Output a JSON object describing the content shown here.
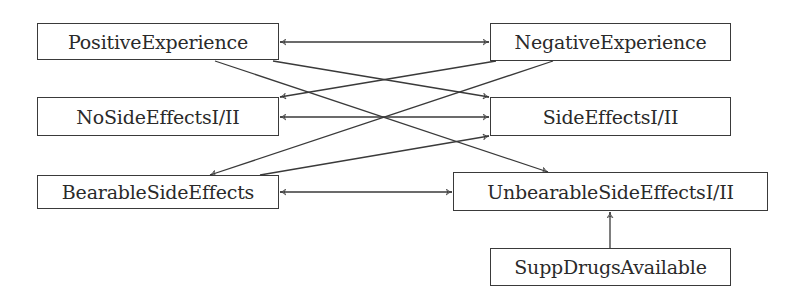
{
  "diagram": {
    "type": "directed-graph",
    "nodes": [
      {
        "id": "positive",
        "label": "PositiveExperience",
        "x": 37,
        "y": 23,
        "w": 242,
        "h": 37
      },
      {
        "id": "noside",
        "label": "NoSideEffectsI/II",
        "x": 37,
        "y": 97,
        "w": 242,
        "h": 39
      },
      {
        "id": "bearable",
        "label": "BearableSideEffects",
        "x": 37,
        "y": 175,
        "w": 242,
        "h": 34
      },
      {
        "id": "negative",
        "label": "NegativeExperience",
        "x": 490,
        "y": 23,
        "w": 241,
        "h": 38
      },
      {
        "id": "sideeffects",
        "label": "SideEffectsI/II",
        "x": 490,
        "y": 97,
        "w": 241,
        "h": 39
      },
      {
        "id": "unbearable",
        "label": "UnbearableSideEffectsI/II",
        "x": 453,
        "y": 172,
        "w": 315,
        "h": 39
      },
      {
        "id": "suppdrugs",
        "label": "SuppDrugsAvailable",
        "x": 490,
        "y": 248,
        "w": 241,
        "h": 38
      }
    ],
    "edges": [
      {
        "from": "positive",
        "to": "negative",
        "bidirectional": true,
        "x1": 280,
        "y1": 42,
        "x2": 489,
        "y2": 42
      },
      {
        "from": "noside",
        "to": "sideeffects",
        "bidirectional": true,
        "x1": 280,
        "y1": 117,
        "x2": 489,
        "y2": 117
      },
      {
        "from": "bearable",
        "to": "unbearable",
        "bidirectional": true,
        "x1": 280,
        "y1": 192,
        "x2": 452,
        "y2": 192
      },
      {
        "from": "positive",
        "to": "sideeffects",
        "bidirectional": false,
        "x1": 273,
        "y1": 61,
        "x2": 489,
        "y2": 97
      },
      {
        "from": "positive",
        "to": "unbearable",
        "bidirectional": false,
        "x1": 215,
        "y1": 61,
        "x2": 548,
        "y2": 172
      },
      {
        "from": "negative",
        "to": "noside",
        "bidirectional": false,
        "x1": 496,
        "y1": 61,
        "x2": 280,
        "y2": 97
      },
      {
        "from": "negative",
        "to": "bearable",
        "bidirectional": false,
        "x1": 553,
        "y1": 61,
        "x2": 210,
        "y2": 175
      },
      {
        "from": "bearable",
        "to": "sideeffects",
        "bidirectional": false,
        "x1": 260,
        "y1": 175,
        "x2": 489,
        "y2": 136
      },
      {
        "from": "suppdrugs",
        "to": "unbearable",
        "bidirectional": false,
        "x1": 610,
        "y1": 248,
        "x2": 610,
        "y2": 212
      }
    ],
    "colors": {
      "stroke": "#3a3a3a",
      "text": "#2a2a2a",
      "background": "#ffffff"
    }
  }
}
